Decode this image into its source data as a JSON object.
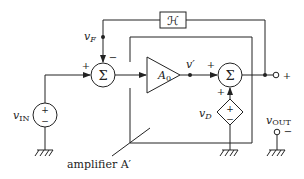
{
  "diagram": {
    "type": "block-diagram",
    "blocks": {
      "feedback": {
        "label": "ℋ"
      },
      "gain": {
        "label": "A",
        "subscript": "0"
      },
      "sum1": {
        "label": "Σ",
        "plus_sign": "+",
        "minus_sign": "−"
      },
      "sum2": {
        "label": "Σ",
        "plus_sign_left": "+",
        "plus_sign_bottom": "+"
      },
      "amplifier_box": {
        "label": "amplifier A′"
      }
    },
    "sources": {
      "input": {
        "label": "v",
        "subscript": "IN",
        "plus": "+",
        "minus": "−"
      },
      "disturbance": {
        "label": "v",
        "subscript": "D",
        "plus": "+",
        "minus": "−"
      }
    },
    "nodes": {
      "feedback_node": {
        "label": "v",
        "subscript": "F"
      },
      "intermediate_node": {
        "label": "v′"
      },
      "output_plus": "+",
      "output_minus": "−",
      "output_label": {
        "label": "v",
        "subscript": "OUT"
      }
    }
  },
  "colors": {
    "stroke": "#222222",
    "background": "#ffffff"
  }
}
